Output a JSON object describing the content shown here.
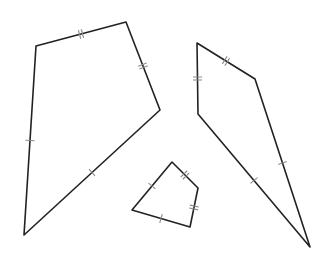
{
  "diagram": {
    "title": "",
    "stroke_color": "#222222",
    "tick_color": "#8a8a8a",
    "background": "#ffffff",
    "shapes": [
      {
        "id": "large-kite-left",
        "vertices": [
          [
            36,
            46
          ],
          [
            126,
            22
          ],
          [
            160,
            110
          ],
          [
            24,
            235
          ]
        ],
        "edges": [
          {
            "from": 0,
            "to": 1,
            "ticks": 2
          },
          {
            "from": 1,
            "to": 2,
            "ticks": 2
          },
          {
            "from": 2,
            "to": 3,
            "ticks": 1
          },
          {
            "from": 3,
            "to": 0,
            "ticks": 1
          }
        ]
      },
      {
        "id": "kite-right",
        "vertices": [
          [
            197,
            43
          ],
          [
            255,
            79
          ],
          [
            310,
            247
          ],
          [
            198,
            114
          ]
        ],
        "edges": [
          {
            "from": 0,
            "to": 1,
            "ticks": 2
          },
          {
            "from": 1,
            "to": 2,
            "ticks": 1
          },
          {
            "from": 2,
            "to": 3,
            "ticks": 1
          },
          {
            "from": 3,
            "to": 0,
            "ticks": 2
          }
        ]
      },
      {
        "id": "small-kite-middle",
        "vertices": [
          [
            172,
            162
          ],
          [
            198,
            188
          ],
          [
            190,
            227
          ],
          [
            132,
            210
          ]
        ],
        "edges": [
          {
            "from": 0,
            "to": 1,
            "ticks": 2
          },
          {
            "from": 1,
            "to": 2,
            "ticks": 2
          },
          {
            "from": 2,
            "to": 3,
            "ticks": 1
          },
          {
            "from": 3,
            "to": 0,
            "ticks": 1
          }
        ]
      }
    ]
  }
}
